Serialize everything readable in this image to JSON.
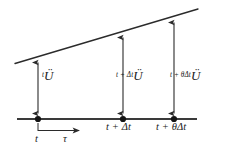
{
  "figure": {
    "type": "diagram",
    "colors": {
      "line": "#2b2b2b",
      "text": "#1a1a1a",
      "background": "#ffffff"
    },
    "curve": {
      "name": "acceleration-line",
      "from": [
        15,
        63
      ],
      "to": [
        198,
        9
      ]
    },
    "axis": {
      "name": "tau-axis",
      "y": 119,
      "from_x": 17,
      "to_x": 197
    },
    "points": [
      {
        "name": "point-t",
        "x": 38,
        "label": "t"
      },
      {
        "name": "point-t-dt",
        "x": 123,
        "label": "t + Δt"
      },
      {
        "name": "point-t-theta",
        "x": 174,
        "label": "t + θΔt"
      }
    ],
    "ordinate_labels": [
      {
        "name": "accel-at-t",
        "superscript": "t",
        "variable": "Ü"
      },
      {
        "name": "accel-at-t-dt",
        "superscript": "t + Δt",
        "variable": "Ü"
      },
      {
        "name": "accel-at-t-theta-dt",
        "superscript": "t + θΔt",
        "variable": "Ü"
      }
    ],
    "axis_labels": {
      "origin": "t",
      "variable": "τ",
      "second": "t + Δt",
      "third": "t + θΔt"
    }
  }
}
